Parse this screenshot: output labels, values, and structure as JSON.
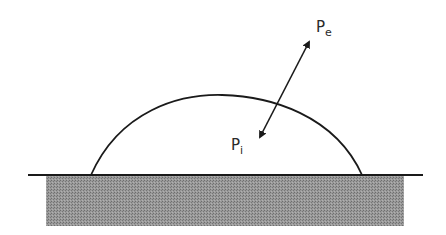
{
  "diagram": {
    "labels": {
      "external_pressure": {
        "main": "P",
        "sub": "e"
      },
      "internal_pressure": {
        "main": "P",
        "sub": "i"
      }
    },
    "colors": {
      "stroke": "#1a1a1a",
      "substrate_fill": "#8c8c8c",
      "background": "#ffffff"
    },
    "elements": [
      {
        "type": "droplet-arc",
        "left_foot": [
          91,
          175
        ],
        "apex": [
          222,
          95
        ],
        "right_foot": [
          362,
          175
        ]
      },
      {
        "type": "baseline",
        "from": [
          28,
          175
        ],
        "to": [
          423,
          175
        ]
      },
      {
        "type": "substrate-block",
        "x": 46,
        "y": 176,
        "width": 358,
        "height": 50
      },
      {
        "type": "double-arrow",
        "from": [
          309,
          42
        ],
        "to": [
          260,
          137
        ]
      }
    ]
  }
}
